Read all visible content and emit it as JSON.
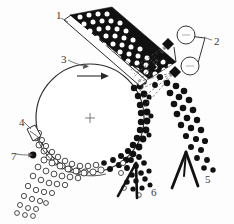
{
  "figure": {
    "caption_partial": "",
    "background_color": "#fdfdfd",
    "ink_color": "#111111",
    "label_color": "#3a3a3a"
  },
  "labels": [
    {
      "id": "1",
      "text": "1",
      "x": 56,
      "y": 10,
      "refers_to": "feed-chute"
    },
    {
      "id": "2",
      "text": "2",
      "x": 214,
      "y": 36,
      "refers_to": "spray-nozzle-assembly"
    },
    {
      "id": "3",
      "text": "3",
      "x": 61,
      "y": 54,
      "refers_to": "rotating-drum"
    },
    {
      "id": "4",
      "text": "4",
      "x": 19,
      "y": 117,
      "refers_to": "scraper-blade"
    },
    {
      "id": "5",
      "text": "5",
      "x": 205,
      "y": 174,
      "refers_to": "product-collector"
    },
    {
      "id": "6",
      "text": "6",
      "x": 151,
      "y": 187,
      "refers_to": "fines-collector"
    },
    {
      "id": "7",
      "text": "7",
      "x": 11,
      "y": 151,
      "refers_to": "seed-particle"
    }
  ],
  "components": {
    "feed_chute": {
      "name": "feed-chute",
      "fill": "#111111",
      "particle_fill": "#ffffff"
    },
    "rotating_drum": {
      "name": "rotating-drum",
      "stroke": "#2a2a2a",
      "center_x": 90,
      "center_y": 118,
      "radius": 54
    },
    "rotation_arrow": {
      "name": "rotation-direction-arrow",
      "direction": "clockwise"
    },
    "drum_center_mark": {
      "name": "drum-center-mark",
      "glyph": "+"
    },
    "spray_nozzles": {
      "name": "spray-nozzle-assembly",
      "count": 2,
      "nozzle_fill": "#111111",
      "spray_stroke": "#555555"
    },
    "valve_circles": {
      "name": "valve-circle",
      "count": 2,
      "stroke": "#333333",
      "fill": "#ffffff"
    },
    "scraper_blade": {
      "name": "scraper-blade",
      "stroke": "#2a2a2a"
    },
    "dark_particles": {
      "name": "dark-particle",
      "fill": "#111111"
    },
    "open_particles": {
      "name": "open-particle",
      "fill": "#ffffff",
      "stroke": "#2a2a2a"
    },
    "collector_left": {
      "name": "fines-collector",
      "fill": "#111111"
    },
    "collector_right": {
      "name": "product-collector",
      "fill": "#111111"
    }
  }
}
